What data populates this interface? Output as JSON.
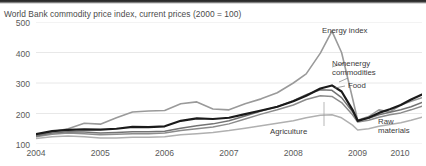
{
  "chart_data": {
    "type": "line",
    "title": "World Bank commodity price index, current prices (2000 = 100)",
    "xlabel": "",
    "ylabel": "",
    "xlim": [
      2004.0,
      2010.0
    ],
    "ylim": [
      100,
      500
    ],
    "yticks": [
      100,
      200,
      300,
      400,
      500
    ],
    "xticks": [
      "2004",
      "2005",
      "2006",
      "2007",
      "2008",
      "2009",
      "2010"
    ],
    "grid": "horizontal",
    "legend": "annotations-inline",
    "x": [
      2004.0,
      2004.25,
      2004.5,
      2004.75,
      2005.0,
      2005.25,
      2005.5,
      2005.75,
      2006.0,
      2006.25,
      2006.5,
      2006.75,
      2007.0,
      2007.25,
      2007.5,
      2007.75,
      2008.0,
      2008.2,
      2008.42,
      2008.6,
      2008.75,
      2008.92,
      2009.0,
      2009.17,
      2009.33,
      2009.5,
      2009.67,
      2009.83,
      2010.0
    ],
    "series": [
      {
        "name": "Energy index",
        "color": "#9a9a9a",
        "width": 1.6,
        "values": [
          128,
          140,
          150,
          168,
          165,
          186,
          205,
          208,
          210,
          232,
          238,
          215,
          212,
          232,
          248,
          268,
          300,
          330,
          398,
          470,
          400,
          250,
          178,
          190,
          212,
          205,
          228,
          240,
          252
        ]
      },
      {
        "name": "Nonenergy commodities",
        "color": "#1a1a1a",
        "width": 2.2,
        "values": [
          132,
          142,
          146,
          148,
          147,
          150,
          156,
          155,
          158,
          176,
          184,
          182,
          186,
          198,
          210,
          222,
          240,
          258,
          282,
          292,
          272,
          212,
          176,
          186,
          202,
          214,
          228,
          246,
          262
        ]
      },
      {
        "name": "Food",
        "color": "#737373",
        "width": 1.5,
        "values": [
          126,
          136,
          140,
          139,
          136,
          138,
          140,
          140,
          142,
          152,
          160,
          166,
          176,
          192,
          208,
          222,
          242,
          262,
          278,
          276,
          252,
          206,
          178,
          184,
          196,
          204,
          212,
          222,
          236
        ]
      },
      {
        "name": "Agriculture",
        "color": "#8c8c8c",
        "width": 1.5,
        "values": [
          124,
          132,
          136,
          134,
          130,
          132,
          134,
          134,
          136,
          144,
          150,
          156,
          166,
          182,
          198,
          212,
          228,
          246,
          258,
          256,
          236,
          196,
          172,
          178,
          188,
          196,
          202,
          212,
          224
        ]
      },
      {
        "name": "Raw materials",
        "color": "#b0b0b0",
        "width": 1.5,
        "values": [
          118,
          124,
          126,
          124,
          120,
          120,
          122,
          122,
          124,
          130,
          134,
          138,
          144,
          152,
          160,
          168,
          176,
          186,
          194,
          196,
          186,
          162,
          146,
          150,
          158,
          164,
          170,
          178,
          188
        ]
      }
    ],
    "annotations": [
      {
        "label": "Energy index",
        "x_px": 322,
        "y_px": 30
      },
      {
        "label": "Nonenergy\ncommodities",
        "x_px": 332,
        "y_px": 62
      },
      {
        "label": "Food",
        "x_px": 345,
        "y_px": 84
      },
      {
        "label": "Agriculture",
        "x_px": 273,
        "y_px": 128
      },
      {
        "label": "Raw\nmaterials",
        "x_px": 382,
        "y_px": 123
      }
    ]
  }
}
